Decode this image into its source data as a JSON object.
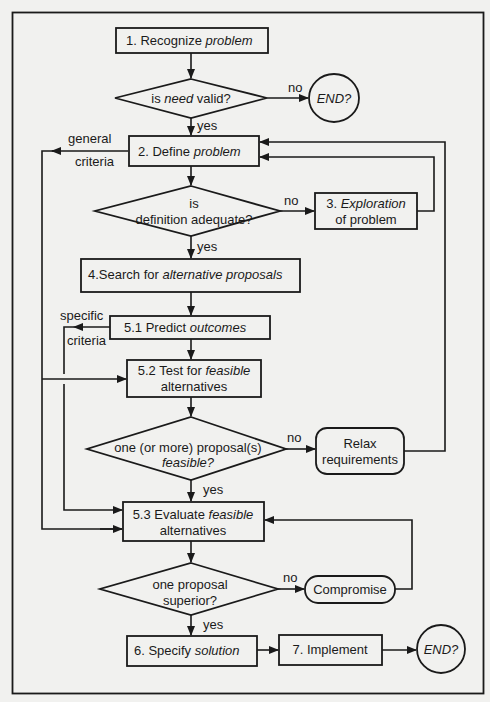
{
  "nodes": {
    "n1": {
      "type": "process",
      "label_pre": "1. Recognize ",
      "label_it": "problem"
    },
    "d1": {
      "type": "decision",
      "label_pre": "is ",
      "label_it": "need",
      "label_post": " valid?"
    },
    "end1": {
      "type": "terminal",
      "label": "END?"
    },
    "n2": {
      "type": "process",
      "label_pre": "2. Define ",
      "label_it": "problem"
    },
    "d2": {
      "type": "decision",
      "line1": "is",
      "line2": "definition adequate?"
    },
    "n3": {
      "type": "process",
      "line1_pre": "3. ",
      "line1_it": "Exploration",
      "line2": "of problem"
    },
    "n4": {
      "type": "process",
      "label_pre": "4.Search for  ",
      "label_it": "alternative proposals"
    },
    "n51": {
      "type": "process",
      "label_pre": "5.1 Predict   ",
      "label_it": "outcomes"
    },
    "n52": {
      "type": "process",
      "line1_pre": "5.2 Test for ",
      "line1_it": "feasible",
      "line2": "alternatives"
    },
    "d3": {
      "type": "decision",
      "line1": "one (or more) proposal(s)",
      "line2_it": "feasible?"
    },
    "relax": {
      "type": "rounded",
      "line1": "Relax",
      "line2": "requirements"
    },
    "n53": {
      "type": "process",
      "line1_pre": "5.3 Evaluate ",
      "line1_it": "feasible",
      "line2": "alternatives"
    },
    "d4": {
      "type": "decision",
      "line1": "one proposal",
      "line2": "superior?"
    },
    "compromise": {
      "type": "rounded",
      "label": "Compromise"
    },
    "n6": {
      "type": "process",
      "label_pre": "6. Specify ",
      "label_it": "solution"
    },
    "n7": {
      "type": "process",
      "label": "7. Implement"
    },
    "end2": {
      "type": "terminal",
      "label": "END?"
    }
  },
  "edge_labels": {
    "yes": "yes",
    "no": "no",
    "general_1": "general",
    "general_2": "criteria",
    "specific_1": "specific",
    "specific_2": "criteria"
  }
}
